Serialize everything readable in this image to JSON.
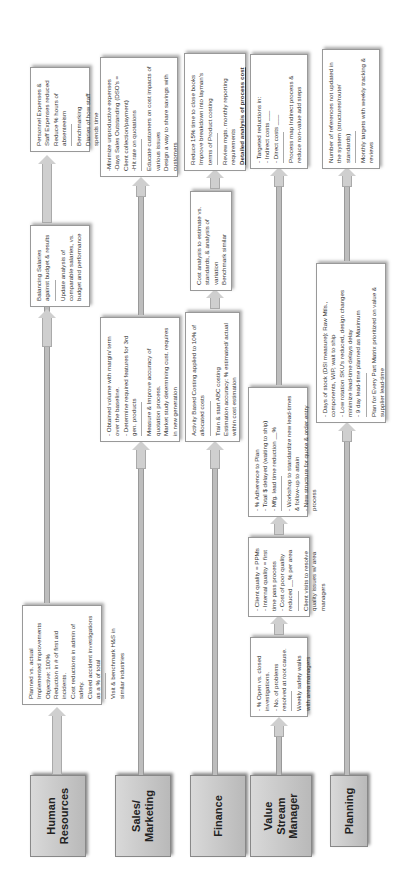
{
  "diagram": {
    "orientation": "rotated-90-ccw",
    "lanes": [
      {
        "name": "Human Resources",
        "label": "Human\nResources",
        "boxes": [
          {
            "lines": [
              "Planned vs. actual Implemented improvements",
              "Objective: 100%",
              "Reduction in # of first aid incidents.",
              "Cost reductions in admin of safety.",
              "Closed accident investigations as a % of total",
              "---",
              "Visit & benchmark H&S in similar industries"
            ]
          },
          {
            "lines": [
              "Balancing Salaries against budget & results",
              "---",
              "Update analysis of comparable salaries, vs. budget and performance"
            ]
          },
          {
            "lines": [
              "Personnel Expenses & Staff Expenses reduced",
              "Reduce % hours of absenteeism",
              "---",
              "Benchmarking",
              "Diaries of how staff spends time"
            ]
          }
        ]
      },
      {
        "name": "Sales/Marketing",
        "label": "Sales/\nMarketing",
        "boxes": [
          {
            "lines": [
              "- Obtained volume with margin/ term over the baseline.",
              "- Determine required features for 3rd gen. products",
              "---",
              "Measure & Improve accuracy of quotation process.",
              "Market study determining cust. requires in new generation"
            ]
          },
          {
            "lines": [
              "-Minimize unproductive expenses",
              "-Days Sales Outstanding (DSO's = Client collection/payment)",
              "-Hit rate on quotations",
              "---",
              "Educate customers on cost impacts of various issues",
              "Design a way to share savings with customers"
            ]
          }
        ]
      },
      {
        "name": "Finance",
        "label": "Finance",
        "boxes": [
          {
            "lines": [
              "Activity Based Costing applied to 10% of allocated costs",
              "---",
              "Train & start ABC costing",
              "Estimation accuracy: % estimated/ actual within cost estimation"
            ]
          },
          {
            "lines": [
              "Cost analysis to estimate vs. standards, & analysis of variation",
              "Benchmark similar"
            ]
          },
          {
            "lines": [
              "Reduce 15% time to close books",
              "Improve breakdown into layman's terms of Product costing",
              "---",
              "Review mgts. monthly reporting requirements",
              "Detailed analysis of process cost"
            ]
          }
        ]
      },
      {
        "name": "Value Stream Manager",
        "label": "Value\nStream\nManager",
        "boxes": [
          {
            "lines": [
              "- % Open vs. closed investigations.",
              "- No. of problems resolved at root cause.",
              "---",
              "Weekly safety walks with area managers"
            ]
          },
          {
            "lines": [
              "- Client quality = PPMs",
              "- Internal quality = first time pass process",
              "- Cost of poor quality reduced __% per area",
              "---",
              "Client visits to resolve quality issues w/ area managers"
            ]
          },
          {
            "lines": [
              "- % Adherence to Plan",
              "- Total $ delayed (waiting to ship)",
              "- Mfg. lead time reduction __%",
              "---",
              "- Workshop to standardize new lead-times & follow-up to attain",
              "- New structure for quote & order entry process"
            ]
          },
          {
            "lines": [
              "- Targeted reductions in:",
              "  - Indirect costs ___",
              "  - Direct costs ___",
              "---",
              "Process map Indirect process & reduce non-value add steps"
            ]
          }
        ]
      },
      {
        "name": "Planning",
        "label": "Planning",
        "boxes": [
          {
            "lines": [
              "- Days of stock (DSI measure): Raw Mtls., components, WIP, wait to ship",
              "- Low rotation SKU's reduced, design changes minimize lead-time delays delay",
              "- 9 day lead-time planned as Maximum",
              "---",
              "Plan for Every Part Matrix prioritized on value & supplier lead-time"
            ]
          },
          {
            "lines": [
              "Number of references not updated in the system (structures/route/ standards)",
              "---",
              "Monthly targets with weekly tracking & reviews"
            ]
          }
        ]
      }
    ]
  }
}
